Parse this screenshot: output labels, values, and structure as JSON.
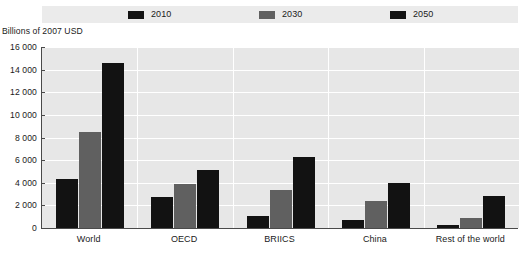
{
  "chart_data": {
    "type": "bar",
    "title": "",
    "subtitle": "",
    "xlabel": "",
    "ylabel": "Billions of 2007 USD",
    "ylim": [
      0,
      16000
    ],
    "yticks": [
      "0",
      "2 000",
      "4 000",
      "6 000",
      "8 000",
      "10 000",
      "12 000",
      "14 000",
      "16 000"
    ],
    "ytick_values": [
      0,
      2000,
      4000,
      6000,
      8000,
      10000,
      12000,
      14000,
      16000
    ],
    "grid": true,
    "legend_position": "top",
    "categories": [
      "World",
      "OECD",
      "BRIICS",
      "China",
      "Rest of the world"
    ],
    "series": [
      {
        "name": "2010",
        "color": "#121212",
        "values": [
          4300,
          2700,
          1100,
          700,
          300
        ]
      },
      {
        "name": "2030",
        "color": "#606060",
        "values": [
          8500,
          3900,
          3400,
          2400,
          900
        ]
      },
      {
        "name": "2050",
        "color": "#121212",
        "values": [
          14600,
          5100,
          6300,
          4000,
          2800
        ]
      }
    ]
  },
  "legend": {
    "entries": [
      {
        "label": "2010",
        "color": "#121212"
      },
      {
        "label": "2030",
        "color": "#606060"
      },
      {
        "label": "2050",
        "color": "#121212"
      }
    ]
  },
  "colors": {
    "plot_background": "#e7e7e7",
    "legend_background": "#ebebeb",
    "gridline": "#ffffff",
    "axis": "#4a4a4a",
    "text": "#1a1a1a"
  }
}
